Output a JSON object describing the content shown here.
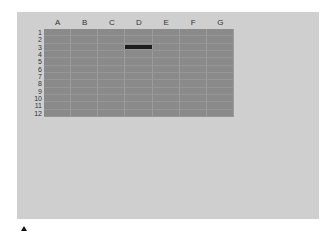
{
  "spreadsheet": {
    "columns": [
      "A",
      "B",
      "C",
      "D",
      "E",
      "F",
      "G"
    ],
    "rows": [
      "1",
      "2",
      "3",
      "4",
      "5",
      "6",
      "7",
      "8",
      "9",
      "10",
      "11",
      "12"
    ],
    "selected_cell": {
      "column": "D",
      "row": "3"
    }
  },
  "colors": {
    "panel": "#cfcfcf",
    "grid": "#8a8a8a",
    "selection": "#1e1e1e"
  },
  "indicator": {
    "icon": "up-triangle-icon"
  }
}
